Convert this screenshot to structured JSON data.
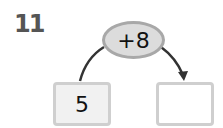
{
  "problem": {
    "number": "11",
    "operation": "+8",
    "start_value": "5",
    "answer_value": ""
  },
  "colors": {
    "oval_fill": "#dcdcdc",
    "oval_border": "#a8a8a8",
    "box_border": "#cfcfcf",
    "arrow": "#333333",
    "number_text": "#555555"
  }
}
